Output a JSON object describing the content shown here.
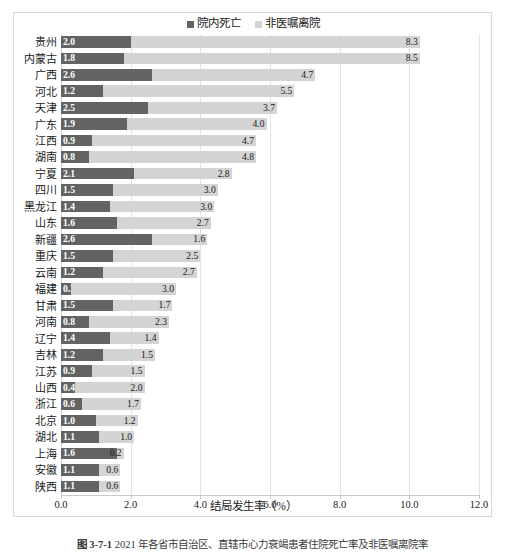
{
  "legend": {
    "items": [
      {
        "label": "院内死亡",
        "color": "#636363",
        "key": "in_hospital_death"
      },
      {
        "label": "非医嘱离院",
        "color": "#d4d4d4",
        "key": "discharge_against_advice"
      }
    ]
  },
  "axis": {
    "x_title": "结局发生率（%）",
    "x_ticks": [
      "0.0",
      "2.0",
      "4.0",
      "6.0",
      "8.0",
      "10.0",
      "12.0"
    ]
  },
  "caption": {
    "number": "图 3-7-1",
    "text": "2021 年各省市自治区、直辖市心力衰竭患者住院死亡率及非医嘱离院率"
  },
  "chart_data": {
    "type": "bar",
    "orientation": "horizontal",
    "stacked": true,
    "title": "",
    "xlabel": "结局发生率（%）",
    "ylabel": "",
    "xlim": [
      0.0,
      12.0
    ],
    "xtick_step": 2.0,
    "grid": "vertical",
    "legend_position": "top-center",
    "categories": [
      "贵州",
      "内蒙古",
      "广西",
      "河北",
      "天津",
      "广东",
      "江西",
      "湖南",
      "宁夏",
      "四川",
      "黑龙江",
      "山东",
      "新疆",
      "重庆",
      "云南",
      "福建",
      "甘肃",
      "河南",
      "辽宁",
      "吉林",
      "江苏",
      "山西",
      "浙江",
      "北京",
      "湖北",
      "上海",
      "安徽",
      "陕西"
    ],
    "series": [
      {
        "name": "院内死亡",
        "color": "#636363",
        "values": [
          2.0,
          1.8,
          2.6,
          1.2,
          2.5,
          1.9,
          0.9,
          0.8,
          2.1,
          1.5,
          1.4,
          1.6,
          2.6,
          1.5,
          1.2,
          0.3,
          1.5,
          0.8,
          1.4,
          1.2,
          0.9,
          0.4,
          0.6,
          1.0,
          1.1,
          1.6,
          1.1,
          1.1
        ]
      },
      {
        "name": "非医嘱离院",
        "color": "#d4d4d4",
        "values": [
          8.3,
          8.5,
          4.7,
          5.5,
          3.7,
          4.0,
          4.7,
          4.8,
          2.8,
          3.0,
          3.0,
          2.7,
          1.6,
          2.5,
          2.7,
          3.0,
          1.7,
          2.3,
          1.4,
          1.5,
          1.5,
          2.0,
          1.7,
          1.2,
          1.0,
          0.2,
          0.6,
          0.6
        ]
      }
    ]
  }
}
